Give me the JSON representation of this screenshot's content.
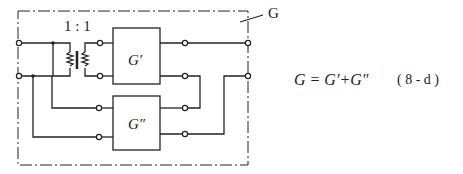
{
  "diagram": {
    "ratio_label": "1 : 1",
    "network_label": "G",
    "block_top_label": "G′",
    "block_bottom_label": "G″",
    "equation": "G = G′+G″",
    "equation_number": "( 8 - d )",
    "colors": {
      "ink": "#222222",
      "background": "#ffffff"
    }
  }
}
